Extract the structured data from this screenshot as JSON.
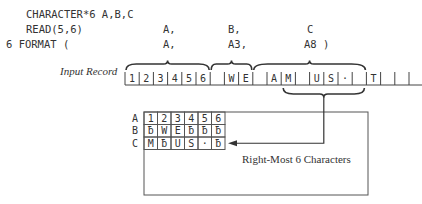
{
  "code": {
    "line1": "CHARACTER*6 A,B,C",
    "line2_stmt": "READ(5,6)",
    "line3_stmt": "6 FORMAT (",
    "read_vars": [
      "A,",
      "B,",
      "C"
    ],
    "format_specs": [
      "A,",
      "A3,",
      "A8 )"
    ]
  },
  "input_record": {
    "label": "Input Record",
    "cells": [
      "1",
      "2",
      "3",
      "4",
      "5",
      "6",
      " ",
      "W",
      "E",
      " ",
      "A",
      "M",
      " ",
      "U",
      "S",
      "·",
      " ",
      "T",
      " ",
      " ",
      " "
    ],
    "fields": [
      {
        "name": "A",
        "spec": "A",
        "start": 0,
        "length": 6
      },
      {
        "name": "B",
        "spec": "A3",
        "start": 6,
        "length": 3
      },
      {
        "name": "C",
        "spec": "A8",
        "start": 9,
        "length": 8
      }
    ],
    "rightmost_brace": {
      "start": 11,
      "length": 6
    }
  },
  "storage": {
    "rows": [
      {
        "label": "A",
        "cells": [
          "1",
          "2",
          "3",
          "4",
          "5",
          "6"
        ]
      },
      {
        "label": "B",
        "cells": [
          "ƀ",
          "W",
          "E",
          "ƀ",
          "ƀ",
          "ƀ"
        ]
      },
      {
        "label": "C",
        "cells": [
          "M",
          "ƀ",
          "U",
          "S",
          "·",
          "ƀ"
        ]
      }
    ],
    "annotation": "Right-Most 6 Characters"
  }
}
